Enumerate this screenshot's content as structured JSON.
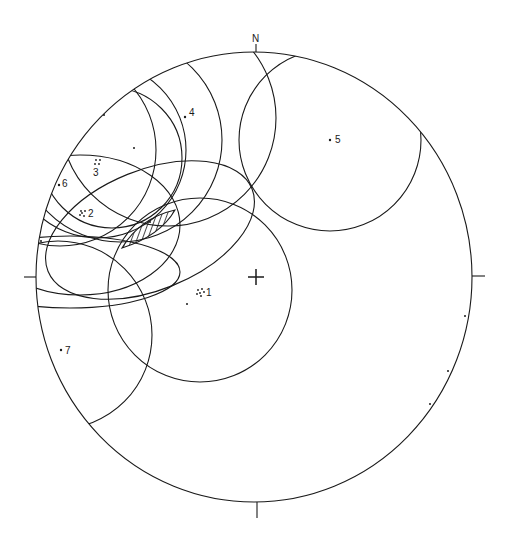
{
  "diagram": {
    "type": "stereonet",
    "north_label": "N",
    "colors": {
      "ink": "#1a1a1a",
      "background": "#ffffff"
    },
    "primitive": {
      "cx": 254,
      "cy": 277,
      "rx": 218,
      "ry": 225
    },
    "center_cross": {
      "x": 256,
      "y": 277
    },
    "points": [
      {
        "id": "1",
        "label": "1",
        "x": 201,
        "y": 292,
        "style": "cluster"
      },
      {
        "id": "2",
        "label": "2",
        "x": 83,
        "y": 213,
        "style": "cluster"
      },
      {
        "id": "3",
        "label": "3",
        "x": 98,
        "y": 162,
        "style": "cluster"
      },
      {
        "id": "4",
        "label": "4",
        "x": 185,
        "y": 117,
        "style": "dot"
      },
      {
        "id": "5",
        "label": "5",
        "x": 330,
        "y": 140,
        "style": "dot"
      },
      {
        "id": "6",
        "label": "6",
        "x": 59,
        "y": 184,
        "style": "dot"
      },
      {
        "id": "7",
        "label": "7",
        "x": 61,
        "y": 350,
        "style": "dot"
      }
    ],
    "unlabeled_dots": [
      {
        "x": 187,
        "y": 304
      },
      {
        "x": 134,
        "y": 147
      },
      {
        "x": 150,
        "y": 222
      },
      {
        "x": 104,
        "y": 115
      },
      {
        "x": 41,
        "y": 241
      },
      {
        "x": 465,
        "y": 316
      },
      {
        "x": 448,
        "y": 371
      },
      {
        "x": 430,
        "y": 404
      }
    ],
    "hatched_region": "intersection lens between cones"
  }
}
